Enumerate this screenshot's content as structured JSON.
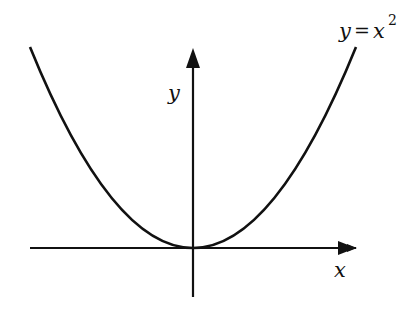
{
  "diagram": {
    "type": "function-graph",
    "function": "y = x^2",
    "labels": {
      "curve_lhs": "y",
      "curve_eq": "=",
      "curve_rhs": "x",
      "curve_exp": "2",
      "x_axis": "x",
      "y_axis": "y"
    },
    "colors": {
      "stroke": "#111111",
      "background": "#ffffff"
    }
  }
}
